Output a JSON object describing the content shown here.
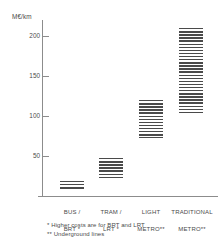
{
  "chart_data": {
    "type": "bar",
    "title": "",
    "subtitle": "",
    "xlabel": "",
    "ylabel": "M€/km",
    "ylim": [
      0,
      230
    ],
    "grid": false,
    "legend": null,
    "value_kind": "range",
    "categories": [
      "BUS /\nBRT *",
      "TRAM /\nLRT *",
      "LIGHT\nMETRO**",
      "TRADITIONAL\nMETRO**"
    ],
    "ticks": [
      200,
      150,
      100,
      50
    ],
    "series": [
      {
        "name": "Infrastructure cost range",
        "ranges": [
          {
            "category": "BUS / BRT *",
            "low": 8,
            "high": 19
          },
          {
            "category": "TRAM / LRT *",
            "low": 22,
            "high": 47
          },
          {
            "category": "LIGHT METRO**",
            "low": 73,
            "high": 120
          },
          {
            "category": "TRADITIONAL METRO**",
            "low": 103,
            "high": 210
          }
        ]
      }
    ],
    "annotations": [
      "* Higher costs are for BRT and LRT",
      "** Underground lines"
    ],
    "colors": {
      "bar_hatch": "#4a4a4a",
      "axis": "#8c8c8c",
      "text": "#4a4a4a",
      "background": "#ffffff"
    }
  },
  "axis": {
    "y_unit_label": "M€/km",
    "tick_labels": [
      "200",
      "150",
      "100",
      "50"
    ]
  },
  "categories": {
    "c0_line1": "BUS /",
    "c0_line2": "BRT *",
    "c1_line1": "TRAM /",
    "c1_line2": "LRT *",
    "c2_line1": "LIGHT",
    "c2_line2": "METRO**",
    "c3_line1": "TRADITIONAL",
    "c3_line2": "METRO**"
  },
  "footnotes": {
    "single_star": "* Higher costs are for BRT and LRT",
    "double_star": "** Underground lines"
  }
}
